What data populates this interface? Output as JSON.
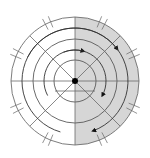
{
  "diagram": {
    "title": "",
    "center": {
      "x": 75,
      "y": 81
    },
    "rings": [
      64,
      42,
      21
    ],
    "shaded_half": "right",
    "colors": {
      "background": "#ffffff",
      "shade": "#d6d6d6",
      "line": "#6e6e6e",
      "dark_line": "#4a4a4a",
      "center_dot": "#000000",
      "arrow": "#333333"
    },
    "spoke_angles_deg": [
      0,
      45,
      90,
      135
    ],
    "hash_mark_angles_deg": [
      25,
      65,
      115,
      155,
      205,
      245,
      295,
      335
    ],
    "arrows": [
      {
        "name": "outer-top-arrow",
        "radius": 53,
        "from_deg": 153,
        "to_deg": 37
      },
      {
        "name": "inner-top-arrow",
        "radius": 31,
        "from_deg": 112,
        "to_deg": 74
      },
      {
        "name": "inner-bottom-arrow",
        "radius": 31,
        "from_deg": 208,
        "to_deg": 332
      },
      {
        "name": "outer-bottom-arrow",
        "radius": 53,
        "from_deg": 254,
        "to_deg": 290
      }
    ]
  }
}
